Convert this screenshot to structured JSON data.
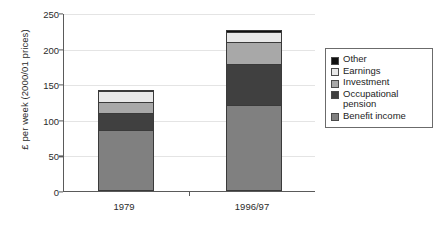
{
  "chart_data": {
    "type": "bar",
    "subtype": "stacked",
    "title": "",
    "xlabel": "",
    "ylabel": "£ per week (2000/01 prices)",
    "categories": [
      "1979",
      "1996/97"
    ],
    "ylim": [
      0,
      250
    ],
    "yticks": [
      0,
      50,
      100,
      150,
      200,
      250
    ],
    "ytick_labels": [
      "0",
      "50",
      "100",
      "150",
      "200",
      "250"
    ],
    "grid": true,
    "legend_position": "right",
    "series": [
      {
        "name": "Benefit income",
        "values": [
          83,
          118
        ],
        "color": "#808080"
      },
      {
        "name": "Occupational pension",
        "values": [
          24,
          58
        ],
        "color": "#404040"
      },
      {
        "name": "Investment",
        "values": [
          15,
          30
        ],
        "color": "#a8a8a8"
      },
      {
        "name": "Earnings",
        "values": [
          15,
          15
        ],
        "color": "#e8e8e8"
      },
      {
        "name": "Other",
        "values": [
          1,
          2
        ],
        "color": "#101010"
      }
    ],
    "totals": [
      138,
      223
    ]
  },
  "legend": {
    "items": [
      {
        "label": "Other",
        "color": "#101010"
      },
      {
        "label": "Earnings",
        "color": "#e8e8e8"
      },
      {
        "label": "Investment",
        "color": "#a8a8a8"
      },
      {
        "label": "Occupational\npension",
        "color": "#404040"
      },
      {
        "label": "Benefit income",
        "color": "#808080"
      }
    ]
  }
}
